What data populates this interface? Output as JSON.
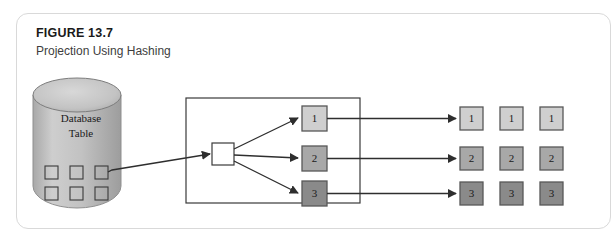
{
  "figure": {
    "number": "FIGURE 13.7",
    "title": "Projection Using Hashing"
  },
  "source": {
    "label_line1": "Database",
    "label_line2": "Table",
    "record_squares": 6
  },
  "hash_box": {
    "name": "hash-function-box",
    "fill": "#ffffff"
  },
  "buckets": [
    {
      "label": "1",
      "fill": "#cfcfcf"
    },
    {
      "label": "2",
      "fill": "#a8a8a8"
    },
    {
      "label": "3",
      "fill": "#8a8a8a"
    }
  ],
  "output_grid": {
    "rows": [
      {
        "label": "1",
        "fill": "#cfcfcf",
        "cells": [
          "1",
          "1",
          "1"
        ]
      },
      {
        "label": "2",
        "fill": "#a8a8a8",
        "cells": [
          "2",
          "2",
          "2"
        ]
      },
      {
        "label": "3",
        "fill": "#8a8a8a",
        "cells": [
          "3",
          "3",
          "3"
        ]
      }
    ]
  },
  "colors": {
    "card_border": "#d9d9d9",
    "stroke": "#3a3a3a",
    "cylinder_light": "#d2d2d2",
    "cylinder_dark": "#a5a5a5",
    "text": "#1a1a1a"
  }
}
